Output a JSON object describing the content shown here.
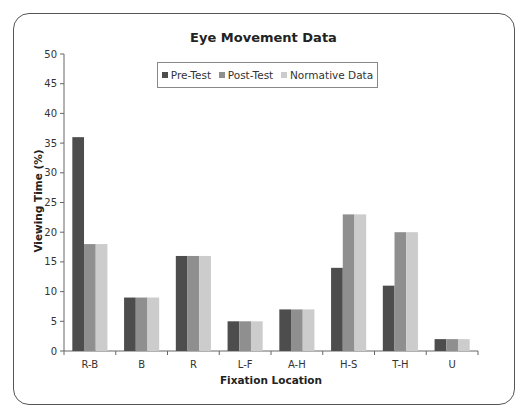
{
  "chart_data": {
    "type": "bar",
    "title": "Eye Movement Data",
    "xlabel": "Fixation Location",
    "ylabel": "Viewing Time (%)",
    "ylim": [
      0,
      50
    ],
    "yticks": [
      0,
      5,
      10,
      15,
      20,
      25,
      30,
      35,
      40,
      45,
      50
    ],
    "grid": false,
    "legend_position": "top-center inside",
    "categories": [
      "R-B",
      "B",
      "R",
      "L-F",
      "A-H",
      "H-S",
      "T-H",
      "U"
    ],
    "series": [
      {
        "name": "Pre-Test",
        "color": "#4d4d4d",
        "values": [
          36,
          9,
          16,
          5,
          7,
          14,
          11,
          2
        ]
      },
      {
        "name": "Post-Test",
        "color": "#8f8f8f",
        "values": [
          18,
          9,
          16,
          5,
          7,
          23,
          20,
          2
        ]
      },
      {
        "name": "Normative Data",
        "color": "#cccccc",
        "values": [
          18,
          9,
          16,
          5,
          7,
          23,
          20,
          2
        ]
      }
    ]
  }
}
